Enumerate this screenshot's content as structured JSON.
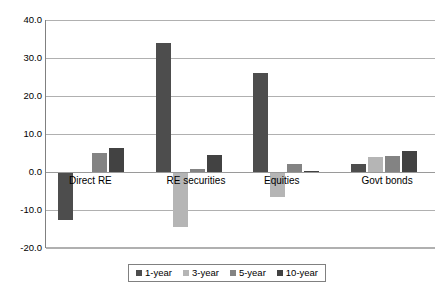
{
  "chart_data": {
    "type": "bar",
    "title": "",
    "subtitle": "",
    "xlabel": "",
    "ylabel": "",
    "ylim": [
      -20.0,
      40.0
    ],
    "grid": true,
    "legend_position": "bottom",
    "orientation": "vertical",
    "grouping": "grouped",
    "categories": [
      "Direct RE",
      "RE securities",
      "Equities",
      "Govt bonds"
    ],
    "ytick_labels": [
      "40.0",
      "30.0",
      "20.0",
      "10.0",
      "0.0",
      "-10.0",
      "-20.0"
    ],
    "ytick_values": [
      40.0,
      30.0,
      20.0,
      10.0,
      0.0,
      -10.0,
      -20.0
    ],
    "series": [
      {
        "name": "1-year",
        "color": "#4d4d4d",
        "values": [
          -12.5,
          34.0,
          26.0,
          2.0
        ]
      },
      {
        "name": "3-year",
        "color": "#b5b5b5",
        "values": [
          0.0,
          -14.5,
          -6.5,
          4.0
        ]
      },
      {
        "name": "5-year",
        "color": "#838383",
        "values": [
          5.0,
          0.8,
          2.0,
          4.2
        ]
      },
      {
        "name": "10-year",
        "color": "#424242",
        "values": [
          6.3,
          4.5,
          0.3,
          5.5
        ]
      }
    ]
  },
  "legend": {
    "items": [
      "1-year",
      "3-year",
      "5-year",
      "10-year"
    ]
  },
  "colors": {
    "axis": "#808080",
    "gridline": "#b0b0b0",
    "zero_line": "#9a9a9a",
    "text": "#000000",
    "background": "#ffffff"
  }
}
